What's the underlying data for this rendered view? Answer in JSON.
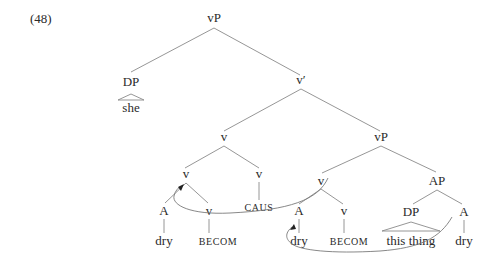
{
  "example_number": "(48)",
  "nodes": {
    "root": "vP",
    "spec_dp": "DP",
    "spec_dp_word": "she",
    "vbar": "v′",
    "v_complex": "v",
    "v_complex_inner": "v",
    "v_caus": "v",
    "caus": "CAUS",
    "a_left": "A",
    "a_left_word": "dry",
    "v_becom_left": "v",
    "becom_left": "BECOM",
    "lower_vp": "vP",
    "lower_v": "v",
    "a_mid": "A",
    "a_mid_word": "dry",
    "v_becom_mid": "v",
    "becom_mid": "BECOM",
    "ap": "AP",
    "ap_dp": "DP",
    "ap_dp_words": "this thing",
    "ap_a": "A",
    "ap_a_word": "dry"
  }
}
